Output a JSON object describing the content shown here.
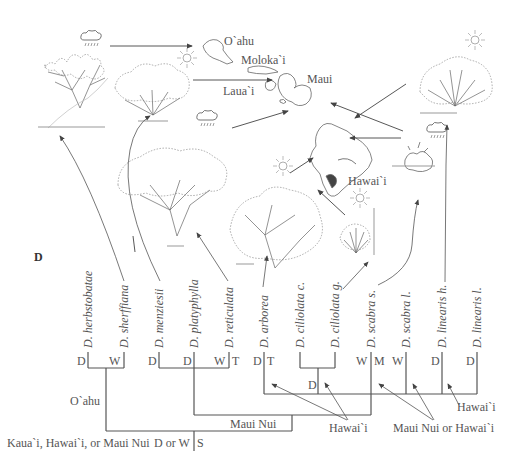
{
  "panel_label": "D",
  "islands": {
    "oahu": "O`ahu",
    "molokai": "Moloka`i",
    "maui": "Maui",
    "lanai": "Laua`i",
    "hawaii": "Hawai`i"
  },
  "species": [
    {
      "name": "D. herbstobatae",
      "x": 97
    },
    {
      "name": "D. sherffiana",
      "x": 133
    },
    {
      "name": "D. menziesii",
      "x": 169
    },
    {
      "name": "D. platyphylla",
      "x": 204
    },
    {
      "name": "D. reticulata",
      "x": 240
    },
    {
      "name": "D. arborea",
      "x": 276
    },
    {
      "name": "D. ciliolata c.",
      "x": 312
    },
    {
      "name": "D. ciliolata g.",
      "x": 348
    },
    {
      "name": "D. scabra s.",
      "x": 384
    },
    {
      "name": "D. scabra l.",
      "x": 419
    },
    {
      "name": "D. linearis h.",
      "x": 455
    },
    {
      "name": "D. linearis l.",
      "x": 490
    }
  ],
  "states": [
    {
      "t": "D",
      "x": 78,
      "y": 359
    },
    {
      "t": "W",
      "x": 109,
      "y": 359
    },
    {
      "t": "D",
      "x": 148,
      "y": 359
    },
    {
      "t": "D",
      "x": 183,
      "y": 359
    },
    {
      "t": "W",
      "x": 215,
      "y": 359
    },
    {
      "t": "T",
      "x": 232,
      "y": 359
    },
    {
      "t": "D",
      "x": 253,
      "y": 359
    },
    {
      "t": "T",
      "x": 270,
      "y": 359
    },
    {
      "t": "D",
      "x": 308,
      "y": 382
    },
    {
      "t": "W",
      "x": 358,
      "y": 359
    },
    {
      "t": "M",
      "x": 376,
      "y": 359
    },
    {
      "t": "W",
      "x": 394,
      "y": 359
    },
    {
      "t": "D",
      "x": 432,
      "y": 359
    },
    {
      "t": "D",
      "x": 467,
      "y": 359
    }
  ],
  "branch_labels": {
    "oahu": "O`ahu",
    "maui_nui": "Maui Nui",
    "hawaii_1": "Hawai`i",
    "hawaii_2": "Hawai`i",
    "maui_nui_or_hawaii": "Maui Nui or Hawai`i",
    "root_location": "Kaua`i, Hawai`i, or Maui Nui",
    "root_state": "D or W",
    "root_state_right": "S"
  },
  "icons": {
    "rain": "rain-cloud-icon",
    "sun": "sun-icon"
  },
  "colors": {
    "line": "#555555",
    "text": "#555555",
    "drawing": "#666666",
    "scale_bar": "#999999"
  }
}
